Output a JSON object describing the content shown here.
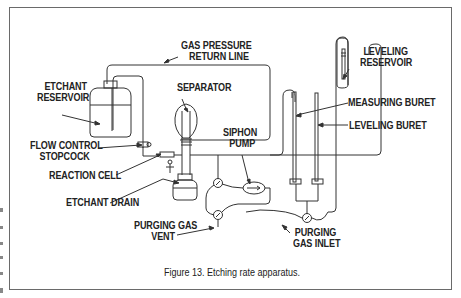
{
  "figure": {
    "caption": "Figure 13.  Etching rate apparatus.",
    "border_color": "#6a6a6a",
    "line_color": "#333333"
  },
  "labels": {
    "gas_pressure_line1": "GAS PRESSURE",
    "gas_pressure_line2": "RETURN LINE",
    "etchant_reservoir_line1": "ETCHANT",
    "etchant_reservoir_line2": "RESERVOIR",
    "separator": "SEPARATOR",
    "flow_control_line1": "FLOW CONTROL",
    "flow_control_line2": "STOPCOCK",
    "reaction_cell": "REACTION CELL",
    "etchant_drain": "ETCHANT DRAIN",
    "siphon_pump_line1": "SIPHON",
    "siphon_pump_line2": "PUMP",
    "purging_gas_vent_line1": "PURGING GAS",
    "purging_gas_vent_line2": "VENT",
    "leveling_reservoir_line1": "LEVELING",
    "leveling_reservoir_line2": "RESERVOIR",
    "measuring_buret": "MEASURING BURET",
    "leveling_buret": "LEVELING BURET",
    "purging_gas_inlet_line1": "PURGING",
    "purging_gas_inlet_line2": "GAS INLET"
  }
}
